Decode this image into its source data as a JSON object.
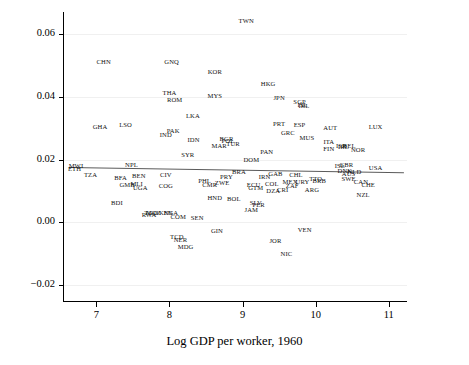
{
  "chart_data": {
    "type": "scatter",
    "title": "",
    "xlabel": "Log GDP per worker, 1960",
    "ylabel": "",
    "xlim": [
      6.55,
      11.25
    ],
    "ylim": [
      -0.025,
      0.067
    ],
    "xticks": [
      "7",
      "8",
      "9",
      "10",
      "11"
    ],
    "xtick_values": [
      7,
      8,
      9,
      10,
      11
    ],
    "yticks": [
      "0.06",
      "0.04",
      "0.02",
      "0.00",
      "−0.02"
    ],
    "ytick_values": [
      0.06,
      0.04,
      0.02,
      0.0,
      -0.02
    ],
    "grid": "light horizontal gridlines at y ticks",
    "legend": "none",
    "marker_style": "three-letter country code text labels (no symbols)",
    "fit_line": {
      "description": "slightly downward sloping regression line",
      "x_start": 6.62,
      "y_start": 0.0175,
      "x_end": 11.2,
      "y_end": 0.0158
    },
    "points": [
      {
        "label": "TWN",
        "x": 9.05,
        "y": 0.0645
      },
      {
        "label": "CHN",
        "x": 7.1,
        "y": 0.0515
      },
      {
        "label": "GNQ",
        "x": 8.03,
        "y": 0.0513
      },
      {
        "label": "KOR",
        "x": 8.62,
        "y": 0.0483
      },
      {
        "label": "HKG",
        "x": 9.35,
        "y": 0.0443
      },
      {
        "label": "THA",
        "x": 8.0,
        "y": 0.0415
      },
      {
        "label": "MYS",
        "x": 8.62,
        "y": 0.0405
      },
      {
        "label": "JPN",
        "x": 9.5,
        "y": 0.0398
      },
      {
        "label": "ROM",
        "x": 8.07,
        "y": 0.0393
      },
      {
        "label": "SGP",
        "x": 9.78,
        "y": 0.0388
      },
      {
        "label": "ISL",
        "x": 9.82,
        "y": 0.0377
      },
      {
        "label": "IRL",
        "x": 9.84,
        "y": 0.0373
      },
      {
        "label": "LKA",
        "x": 8.32,
        "y": 0.0343
      },
      {
        "label": "GHA",
        "x": 7.05,
        "y": 0.0308
      },
      {
        "label": "LSO",
        "x": 7.4,
        "y": 0.0312
      },
      {
        "label": "PRT",
        "x": 9.5,
        "y": 0.0318
      },
      {
        "label": "ESP",
        "x": 9.78,
        "y": 0.0313
      },
      {
        "label": "AUT",
        "x": 10.2,
        "y": 0.0305
      },
      {
        "label": "LUX",
        "x": 10.82,
        "y": 0.0308
      },
      {
        "label": "PAK",
        "x": 8.05,
        "y": 0.0293
      },
      {
        "label": "IND",
        "x": 7.95,
        "y": 0.0283
      },
      {
        "label": "GRC",
        "x": 9.62,
        "y": 0.0288
      },
      {
        "label": "MUS",
        "x": 9.88,
        "y": 0.0272
      },
      {
        "label": "IDN",
        "x": 8.33,
        "y": 0.0265
      },
      {
        "label": "BGR",
        "x": 8.78,
        "y": 0.0268
      },
      {
        "label": "POL",
        "x": 8.8,
        "y": 0.0262
      },
      {
        "label": "TUR",
        "x": 8.87,
        "y": 0.0252
      },
      {
        "label": "MAR",
        "x": 8.68,
        "y": 0.0248
      },
      {
        "label": "ITA",
        "x": 10.18,
        "y": 0.0258
      },
      {
        "label": "ISR",
        "x": 10.35,
        "y": 0.0248
      },
      {
        "label": "IRL2",
        "x": 10.38,
        "y": 0.0245
      },
      {
        "label": "BEL",
        "x": 10.46,
        "y": 0.0248
      },
      {
        "label": "FIN",
        "x": 10.18,
        "y": 0.0238
      },
      {
        "label": "NOR",
        "x": 10.58,
        "y": 0.0235
      },
      {
        "label": "SYR",
        "x": 8.25,
        "y": 0.0218
      },
      {
        "label": "PAN",
        "x": 9.33,
        "y": 0.0228
      },
      {
        "label": "DOM",
        "x": 9.12,
        "y": 0.0203
      },
      {
        "label": "MWI",
        "x": 6.72,
        "y": 0.0183
      },
      {
        "label": "NPL",
        "x": 7.48,
        "y": 0.0185
      },
      {
        "label": "ETH",
        "x": 6.7,
        "y": 0.0172
      },
      {
        "label": "ISL2",
        "x": 10.33,
        "y": 0.0183
      },
      {
        "label": "GBR",
        "x": 10.42,
        "y": 0.0185
      },
      {
        "label": "USA",
        "x": 10.82,
        "y": 0.0178
      },
      {
        "label": "BRA",
        "x": 8.95,
        "y": 0.0163
      },
      {
        "label": "DNK",
        "x": 10.4,
        "y": 0.0168
      },
      {
        "label": "NLD",
        "x": 10.53,
        "y": 0.0165
      },
      {
        "label": "TZA",
        "x": 6.92,
        "y": 0.0155
      },
      {
        "label": "GAB",
        "x": 9.45,
        "y": 0.0158
      },
      {
        "label": "AUS",
        "x": 10.45,
        "y": 0.0158
      },
      {
        "label": "CIV",
        "x": 7.95,
        "y": 0.0155
      },
      {
        "label": "CHL",
        "x": 9.73,
        "y": 0.0153
      },
      {
        "label": "PRY",
        "x": 8.78,
        "y": 0.0148
      },
      {
        "label": "IRN",
        "x": 9.3,
        "y": 0.0148
      },
      {
        "label": "TTO",
        "x": 10.0,
        "y": 0.0143
      },
      {
        "label": "URY",
        "x": 9.82,
        "y": 0.0133
      },
      {
        "label": "SWE",
        "x": 10.45,
        "y": 0.0143
      },
      {
        "label": "CAN",
        "x": 10.62,
        "y": 0.0133
      },
      {
        "label": "BEN",
        "x": 7.58,
        "y": 0.0152
      },
      {
        "label": "BFA",
        "x": 7.33,
        "y": 0.0145
      },
      {
        "label": "BRB",
        "x": 10.05,
        "y": 0.0135
      },
      {
        "label": "PHL",
        "x": 8.48,
        "y": 0.0135
      },
      {
        "label": "ZWE",
        "x": 8.72,
        "y": 0.0128
      },
      {
        "label": "CMR",
        "x": 8.55,
        "y": 0.0122
      },
      {
        "label": "MEX",
        "x": 9.65,
        "y": 0.0132
      },
      {
        "label": "COL",
        "x": 9.4,
        "y": 0.0125
      },
      {
        "label": "ECU",
        "x": 9.15,
        "y": 0.0122
      },
      {
        "label": "GMB",
        "x": 7.42,
        "y": 0.0122
      },
      {
        "label": "MLI",
        "x": 7.55,
        "y": 0.0125
      },
      {
        "label": "COG",
        "x": 7.95,
        "y": 0.0118
      },
      {
        "label": "UGA",
        "x": 7.6,
        "y": 0.0112
      },
      {
        "label": "CHE",
        "x": 10.72,
        "y": 0.0122
      },
      {
        "label": "ZAF",
        "x": 9.68,
        "y": 0.0118
      },
      {
        "label": "GTM",
        "x": 9.18,
        "y": 0.0112
      },
      {
        "label": "CRI",
        "x": 9.55,
        "y": 0.0108
      },
      {
        "label": "DZA",
        "x": 9.42,
        "y": 0.0102
      },
      {
        "label": "ARG",
        "x": 9.95,
        "y": 0.0108
      },
      {
        "label": "NZL",
        "x": 10.65,
        "y": 0.0092
      },
      {
        "label": "HND",
        "x": 8.62,
        "y": 0.0082
      },
      {
        "label": "BOL",
        "x": 8.88,
        "y": 0.0078
      },
      {
        "label": "BDI",
        "x": 7.28,
        "y": 0.0065
      },
      {
        "label": "SLV",
        "x": 9.18,
        "y": 0.0065
      },
      {
        "label": "PER",
        "x": 9.22,
        "y": 0.0058
      },
      {
        "label": "JAM",
        "x": 9.12,
        "y": 0.0043
      },
      {
        "label": "TGO",
        "x": 7.75,
        "y": 0.0032
      },
      {
        "label": "RWA",
        "x": 7.72,
        "y": 0.0028
      },
      {
        "label": "MOZ",
        "x": 7.78,
        "y": 0.0032
      },
      {
        "label": "KEN",
        "x": 7.95,
        "y": 0.0032
      },
      {
        "label": "NGA",
        "x": 8.02,
        "y": 0.0032
      },
      {
        "label": "COM",
        "x": 8.12,
        "y": 0.0022
      },
      {
        "label": "SEN",
        "x": 8.38,
        "y": 0.0018
      },
      {
        "label": "GIN",
        "x": 8.65,
        "y": -0.0025
      },
      {
        "label": "VEN",
        "x": 9.85,
        "y": -0.0022
      },
      {
        "label": "TCD",
        "x": 8.1,
        "y": -0.0042
      },
      {
        "label": "NER",
        "x": 8.15,
        "y": -0.0052
      },
      {
        "label": "JOR",
        "x": 9.45,
        "y": -0.0055
      },
      {
        "label": "MDG",
        "x": 8.22,
        "y": -0.0075
      },
      {
        "label": "NIC",
        "x": 9.6,
        "y": -0.0098
      }
    ]
  }
}
